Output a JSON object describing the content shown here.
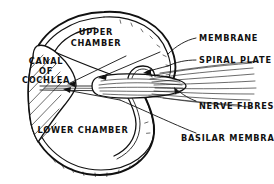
{
  "figure": {
    "type": "anatomical-line-diagram",
    "background_color": "#ffffff",
    "ink_color": "#111111",
    "width": 274,
    "height": 184
  },
  "labels": {
    "upper_chamber_line1": "UPPER",
    "upper_chamber_line2": "CHAMBER",
    "canal_line1": "CANAL",
    "canal_line2": "OF",
    "canal_line3": "COCHLEA",
    "lower_chamber": "LOWER CHAMBER",
    "membrane": "MEMBRANE",
    "spiral_plate": "SPIRAL PLATE",
    "nerve_fibres": "NERVE FIBRES",
    "basilar_membrane": "BASILAR MEMBRANE"
  },
  "parts": [
    {
      "name": "upper-chamber",
      "label": "UPPER CHAMBER",
      "leader": false
    },
    {
      "name": "canal-of-cochlea",
      "label": "CANAL OF COCHLEA",
      "leader": false
    },
    {
      "name": "lower-chamber",
      "label": "LOWER CHAMBER",
      "leader": false
    },
    {
      "name": "membrane",
      "label": "MEMBRANE",
      "leader": true
    },
    {
      "name": "spiral-plate",
      "label": "SPIRAL PLATE",
      "leader": true
    },
    {
      "name": "nerve-fibres",
      "label": "NERVE FIBRES",
      "leader": true
    },
    {
      "name": "basilar-membrane",
      "label": "BASILAR MEMBRANE",
      "leader": true
    }
  ]
}
